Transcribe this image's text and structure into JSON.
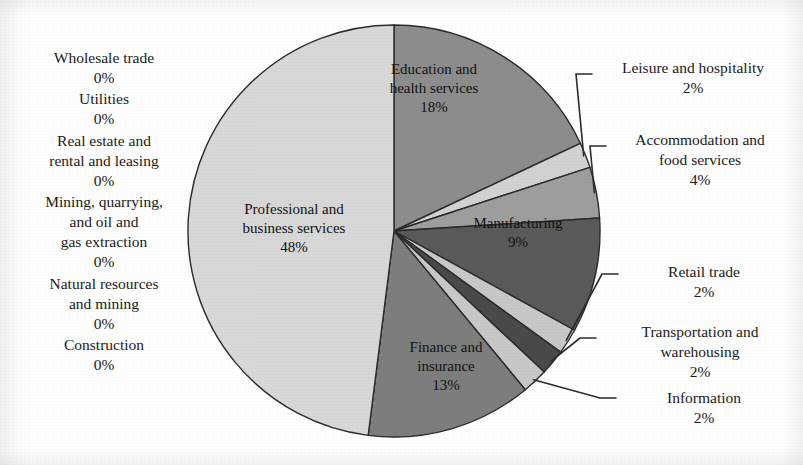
{
  "chart_data": {
    "type": "pie",
    "title": "",
    "subtitle": "",
    "xlabel": "",
    "ylabel": "",
    "legend_position": "none",
    "grid": false,
    "value_unit": "%",
    "categories": [
      "Education and health services",
      "Leisure and hospitality",
      "Accommodation and food services",
      "Manufacturing",
      "Retail trade",
      "Transportation and warehousing",
      "Information",
      "Finance and insurance",
      "Construction",
      "Natural resources and mining",
      "Mining, quarrying, and oil and gas extraction",
      "Real estate and rental and leasing",
      "Utilities",
      "Wholesale trade",
      "Professional and business services"
    ],
    "values": [
      18,
      2,
      4,
      9,
      2,
      2,
      2,
      13,
      0,
      0,
      0,
      0,
      0,
      0,
      48
    ],
    "slices": [
      {
        "id": "education",
        "name": "Education and\nhealth services",
        "name_line1": "Education and",
        "name_line2": "health services",
        "value": 18,
        "pct_label": "18%",
        "shade": "#8d8d8d",
        "label_placement": "inside"
      },
      {
        "id": "leisure",
        "name_line1": "Leisure and hospitality",
        "name_line2": "",
        "value": 2,
        "pct_label": "2%",
        "shade": "#d2d2d2",
        "label_placement": "callout"
      },
      {
        "id": "accommodation",
        "name_line1": "Accommodation and",
        "name_line2": "food services",
        "value": 4,
        "pct_label": "4%",
        "shade": "#9e9e9e",
        "label_placement": "callout"
      },
      {
        "id": "manufacturing",
        "name_line1": "Manufacturing",
        "name_line2": "",
        "value": 9,
        "pct_label": "9%",
        "shade": "#5a5a5a",
        "label_placement": "inside"
      },
      {
        "id": "retail",
        "name_line1": "Retail trade",
        "name_line2": "",
        "value": 2,
        "pct_label": "2%",
        "shade": "#c8c8c8",
        "label_placement": "callout"
      },
      {
        "id": "transportation",
        "name_line1": "Transportation and",
        "name_line2": "warehousing",
        "value": 2,
        "pct_label": "2%",
        "shade": "#4a4a4a",
        "label_placement": "callout"
      },
      {
        "id": "information",
        "name_line1": "Information",
        "name_line2": "",
        "value": 2,
        "pct_label": "2%",
        "shade": "#c8c8c8",
        "label_placement": "callout"
      },
      {
        "id": "finance",
        "name_line1": "Finance and",
        "name_line2": "insurance",
        "value": 13,
        "pct_label": "13%",
        "shade": "#7e7e7e",
        "label_placement": "inside"
      },
      {
        "id": "professional",
        "name_line1": "Professional and",
        "name_line2": "business services",
        "value": 48,
        "pct_label": "48%",
        "shade": "#d8d8d8",
        "label_placement": "inside"
      }
    ],
    "zero_categories": [
      {
        "id": "wholesale",
        "lines": [
          "Wholesale trade"
        ],
        "pct_label": "0%",
        "value": 0
      },
      {
        "id": "utilities",
        "lines": [
          "Utilities"
        ],
        "pct_label": "0%",
        "value": 0
      },
      {
        "id": "realestate",
        "lines": [
          "Real estate and",
          "rental and leasing"
        ],
        "pct_label": "0%",
        "value": 0
      },
      {
        "id": "mining-qog",
        "lines": [
          "Mining, quarrying,",
          "and oil and",
          "gas extraction"
        ],
        "pct_label": "0%",
        "value": 0
      },
      {
        "id": "natres",
        "lines": [
          "Natural resources",
          "and mining"
        ],
        "pct_label": "0%",
        "value": 0
      },
      {
        "id": "construction",
        "lines": [
          "Construction"
        ],
        "pct_label": "0%",
        "value": 0
      }
    ]
  },
  "left_column": {
    "wholesale_name": "Wholesale trade",
    "wholesale_pct": "0%",
    "utilities_name": "Utilities",
    "utilities_pct": "0%",
    "realestate_l1": "Real estate and",
    "realestate_l2": "rental and leasing",
    "realestate_pct": "0%",
    "mining_l1": "Mining, quarrying,",
    "mining_l2": "and oil and",
    "mining_l3": "gas extraction",
    "mining_pct": "0%",
    "natres_l1": "Natural resources",
    "natres_l2": "and mining",
    "natres_pct": "0%",
    "construction_name": "Construction",
    "construction_pct": "0%"
  },
  "pie_labels": {
    "professional_l1": "Professional and",
    "professional_l2": "business services",
    "professional_pct": "48%",
    "education_l1": "Education and",
    "education_l2": "health services",
    "education_pct": "18%",
    "manufacturing_l1": "Manufacturing",
    "manufacturing_pct": "9%",
    "finance_l1": "Finance and",
    "finance_l2": "insurance",
    "finance_pct": "13%"
  },
  "callouts": {
    "leisure_l1": "Leisure and hospitality",
    "leisure_pct": "2%",
    "accommodation_l1": "Accommodation and",
    "accommodation_l2": "food services",
    "accommodation_pct": "4%",
    "retail_l1": "Retail trade",
    "retail_pct": "2%",
    "transportation_l1": "Transportation and",
    "transportation_l2": "warehousing",
    "transportation_pct": "2%",
    "information_l1": "Information",
    "information_pct": "2%"
  },
  "colors": {
    "outline": "#2b2b2b",
    "text": "#161616",
    "background": "#ffffff",
    "shade_lightest": "#d8d8d8",
    "shade_light": "#c8c8c8",
    "shade_mid": "#8d8d8d",
    "shade_mid_dark": "#7e7e7e",
    "shade_dark": "#5a5a5a",
    "shade_darkest": "#4a4a4a"
  },
  "geometry": {
    "center_x": 394,
    "center_y": 231,
    "radius": 206
  }
}
